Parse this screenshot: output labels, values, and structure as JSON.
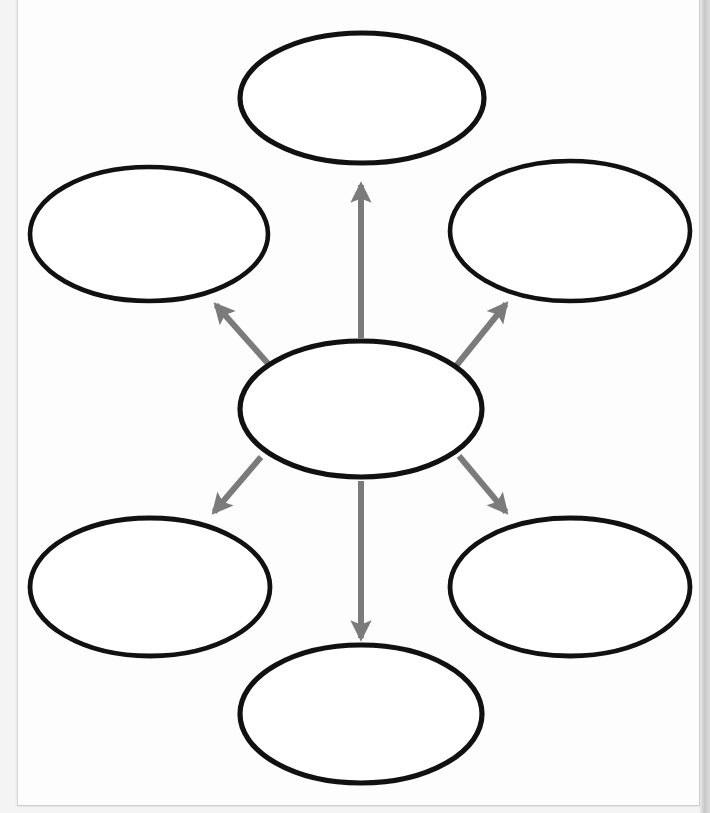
{
  "document": {
    "type": "worksheet",
    "title": "Blank Concept Map Graphic Organizer",
    "page_background": "#ffffff",
    "paper_color": "#fdfdfd"
  },
  "diagram": {
    "kind": "concept-map",
    "center_node_id": "center",
    "node_outline_color": "#111111",
    "node_fill_color": "#ffffff",
    "node_stroke_width": 5,
    "arrow_color": "#7b7b7b",
    "arrow_stroke_width": 6,
    "nodes": [
      {
        "id": "top",
        "label": "",
        "cx": 362,
        "cy": 98,
        "rx": 122,
        "ry": 65,
        "stroke_width": 5.2
      },
      {
        "id": "top-left",
        "label": "",
        "cx": 149,
        "cy": 234,
        "rx": 119,
        "ry": 67,
        "stroke_width": 4.6
      },
      {
        "id": "top-right",
        "label": "",
        "cx": 570,
        "cy": 231,
        "rx": 120,
        "ry": 70,
        "stroke_width": 4.6
      },
      {
        "id": "center",
        "label": "",
        "cx": 361,
        "cy": 409,
        "rx": 121,
        "ry": 68,
        "stroke_width": 5.2
      },
      {
        "id": "bottom-left",
        "label": "",
        "cx": 150,
        "cy": 587,
        "rx": 120,
        "ry": 69,
        "stroke_width": 4.8
      },
      {
        "id": "bottom-right",
        "label": "",
        "cx": 570,
        "cy": 587,
        "rx": 120,
        "ry": 69,
        "stroke_width": 4.8
      },
      {
        "id": "bottom",
        "label": "",
        "cx": 361,
        "cy": 714,
        "rx": 121,
        "ry": 69,
        "stroke_width": 5.2
      }
    ],
    "connectors": [
      {
        "id": "center-to-top",
        "from": "center",
        "to": "top",
        "x1": 361,
        "y1": 338,
        "x2": 361,
        "y2": 185,
        "direction": "up",
        "arrowhead": "end"
      },
      {
        "id": "center-to-top-left",
        "from": "center",
        "to": "top-left",
        "x1": 271,
        "y1": 367,
        "x2": 216,
        "y2": 305,
        "direction": "up-left",
        "arrowhead": "end"
      },
      {
        "id": "center-to-top-right",
        "from": "center",
        "to": "top-right",
        "x1": 456,
        "y1": 366,
        "x2": 506,
        "y2": 304,
        "direction": "up-right",
        "arrowhead": "end"
      },
      {
        "id": "center-to-bottom",
        "from": "center",
        "to": "bottom",
        "x1": 361,
        "y1": 481,
        "x2": 361,
        "y2": 638,
        "direction": "down",
        "arrowhead": "end"
      },
      {
        "id": "center-to-bottom-left",
        "from": "center",
        "to": "bottom-left",
        "x1": 261,
        "y1": 457,
        "x2": 214,
        "y2": 512,
        "direction": "down-left",
        "arrowhead": "end"
      },
      {
        "id": "center-to-bottom-right",
        "from": "center",
        "to": "bottom-right",
        "x1": 459,
        "y1": 456,
        "x2": 506,
        "y2": 512,
        "direction": "down-right",
        "arrowhead": "end"
      }
    ]
  },
  "chart_data": {
    "type": "diagram",
    "layout": "radial / spider map, 1 central node with 6 satellite nodes",
    "node_count": 7,
    "connector_count": 6,
    "node_labels": [
      "",
      "",
      "",
      "",
      "",
      "",
      ""
    ]
  }
}
